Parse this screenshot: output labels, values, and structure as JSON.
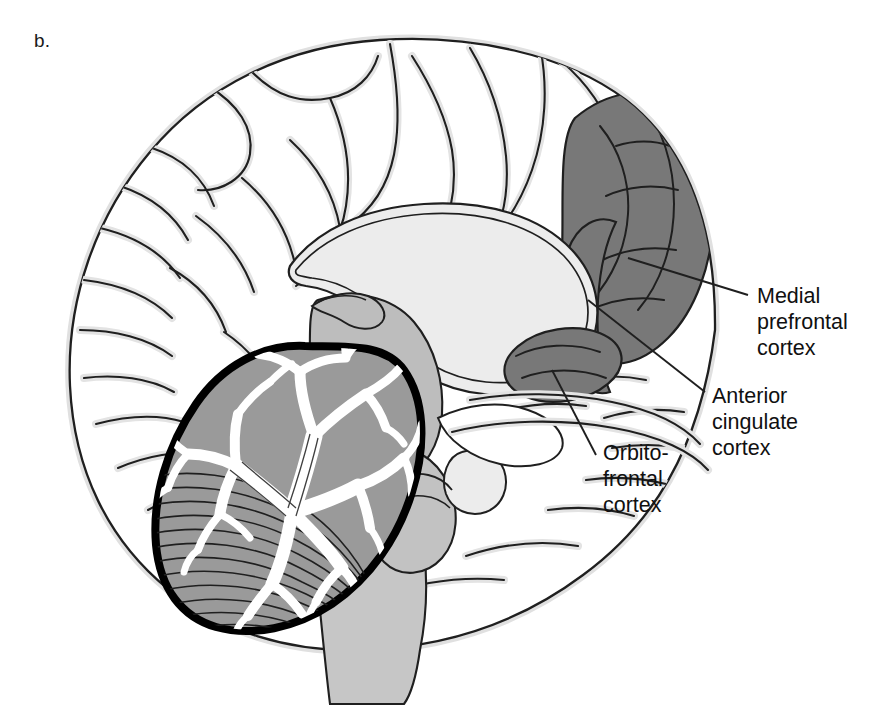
{
  "figure": {
    "panel_letter": "b.",
    "view": "mid-sagittal brain section"
  },
  "labels": {
    "medial_prefrontal": "Medial\nprefrontal\ncortex",
    "anterior_cingulate": "Anterior\ncingulate\ncortex",
    "orbitofrontal": "Orbito-\nfrontal\ncortex"
  },
  "colors": {
    "background": "#ffffff",
    "outline": "#1a1a1a",
    "halo": "#e2e2e2",
    "highlight_region": "#787878",
    "corpus_callosum": "#ececec",
    "deep_structures": "#bdbdbd",
    "cerebellum_cortex": "#9a9a9a",
    "cerebellum_outline": "#000000",
    "arbor_vitae": "#ffffff",
    "text": "#101010"
  },
  "regions": [
    {
      "name": "Medial prefrontal cortex",
      "shading": "dark-gray",
      "location": "anterior superior medial surface"
    },
    {
      "name": "Anterior cingulate cortex",
      "shading": "dark-gray",
      "location": "anterior band around genu of corpus callosum"
    },
    {
      "name": "Orbitofrontal cortex",
      "shading": "dark-gray",
      "location": "ventral frontal, above orbit"
    },
    {
      "name": "Corpus callosum",
      "shading": "very-light-gray",
      "location": "central arch"
    },
    {
      "name": "Thalamus and brainstem",
      "shading": "medium-gray",
      "location": "central and inferior"
    },
    {
      "name": "Cerebellum",
      "shading": "gray with white arbor vitae",
      "location": "posterior inferior"
    }
  ]
}
